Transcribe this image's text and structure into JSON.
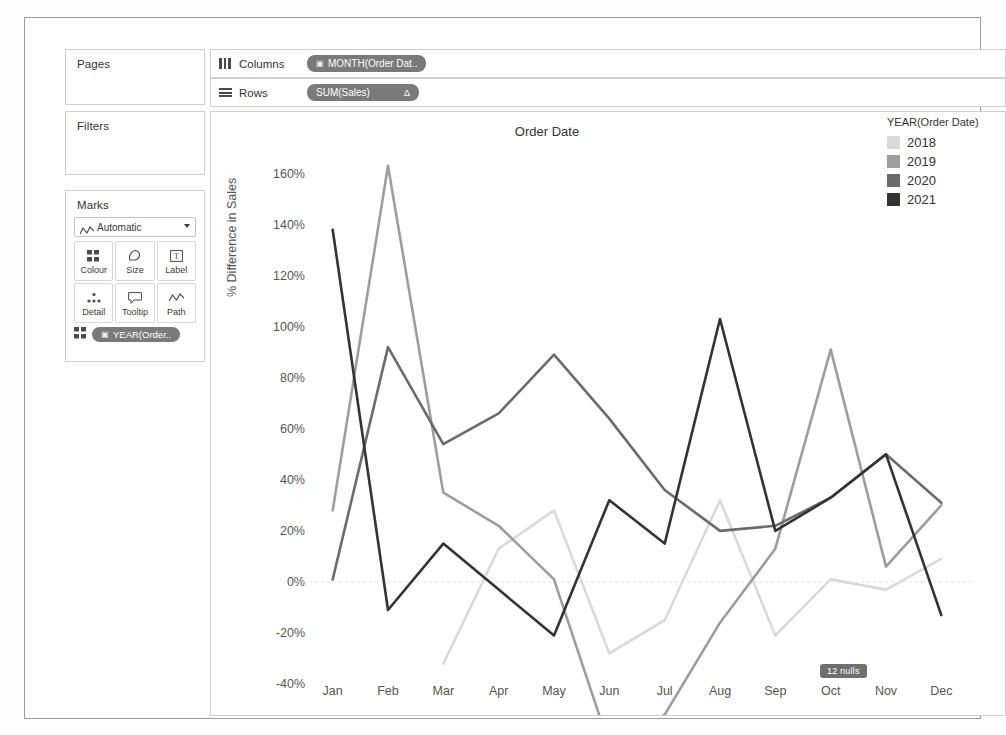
{
  "shelves": {
    "pages_label": "Pages",
    "filters_label": "Filters",
    "marks_label": "Marks",
    "columns_label": "Columns",
    "rows_label": "Rows",
    "columns_pill": "MONTH(Order Dat..",
    "columns_pill_icon": "calendar-icon",
    "rows_pill": "SUM(Sales)",
    "rows_pill_delta": "Δ",
    "columns_icon": "columns-icon",
    "rows_icon": "rows-icon"
  },
  "marks": {
    "mark_type": "Automatic",
    "mark_type_icon": "line-icon",
    "buttons": [
      {
        "label": "Colour",
        "icon": "colour-icon"
      },
      {
        "label": "Size",
        "icon": "size-icon"
      },
      {
        "label": "Label",
        "icon": "label-icon"
      },
      {
        "label": "Detail",
        "icon": "detail-icon"
      },
      {
        "label": "Tooltip",
        "icon": "tooltip-icon"
      },
      {
        "label": "Path",
        "icon": "path-icon"
      }
    ],
    "pill": "YEAR(Order..",
    "pill_icon": "calendar-icon",
    "pill_prefix_icon": "colour-icon"
  },
  "legend": {
    "title": "YEAR(Order Date)",
    "items": [
      {
        "label": "2018",
        "colour": "#d9d9d9"
      },
      {
        "label": "2019",
        "colour": "#9d9d9d"
      },
      {
        "label": "2020",
        "colour": "#6b6b6b"
      },
      {
        "label": "2021",
        "colour": "#333333"
      }
    ]
  },
  "viz": {
    "nulls_badge": "12 nulls"
  },
  "chart_data": {
    "type": "line",
    "title": "Order Date",
    "xlabel": "",
    "ylabel": "% Difference in Sales",
    "categories": [
      "Jan",
      "Feb",
      "Mar",
      "Apr",
      "May",
      "Jun",
      "Jul",
      "Aug",
      "Sep",
      "Oct",
      "Nov",
      "Dec"
    ],
    "ylim": [
      -40,
      170
    ],
    "yticks": [
      160,
      140,
      120,
      100,
      80,
      60,
      40,
      20,
      0,
      -20,
      -40
    ],
    "ytick_labels": [
      "160%",
      "140%",
      "120%",
      "100%",
      "80%",
      "60%",
      "40%",
      "20%",
      "0%",
      "-20%",
      "-40%"
    ],
    "grid": false,
    "zero_line": true,
    "legend_position": "right",
    "legend_title": "YEAR(Order Date)",
    "series": [
      {
        "name": "2018",
        "colour": "#d9d9d9",
        "values": [
          null,
          null,
          -32,
          13,
          28,
          -28,
          -15,
          32,
          -21,
          1,
          -3,
          9
        ]
      },
      {
        "name": "2019",
        "colour": "#9d9d9d",
        "values": [
          28,
          163,
          35,
          22,
          1,
          -64,
          -52,
          -16,
          13,
          91,
          6,
          30
        ]
      },
      {
        "name": "2020",
        "colour": "#6b6b6b",
        "values": [
          1,
          92,
          54,
          66,
          89,
          64,
          36,
          20,
          22,
          33,
          50,
          31
        ]
      },
      {
        "name": "2021",
        "colour": "#333333",
        "values": [
          138,
          -11,
          15,
          -3,
          -21,
          32,
          15,
          103,
          20,
          33,
          50,
          -13
        ]
      }
    ]
  }
}
